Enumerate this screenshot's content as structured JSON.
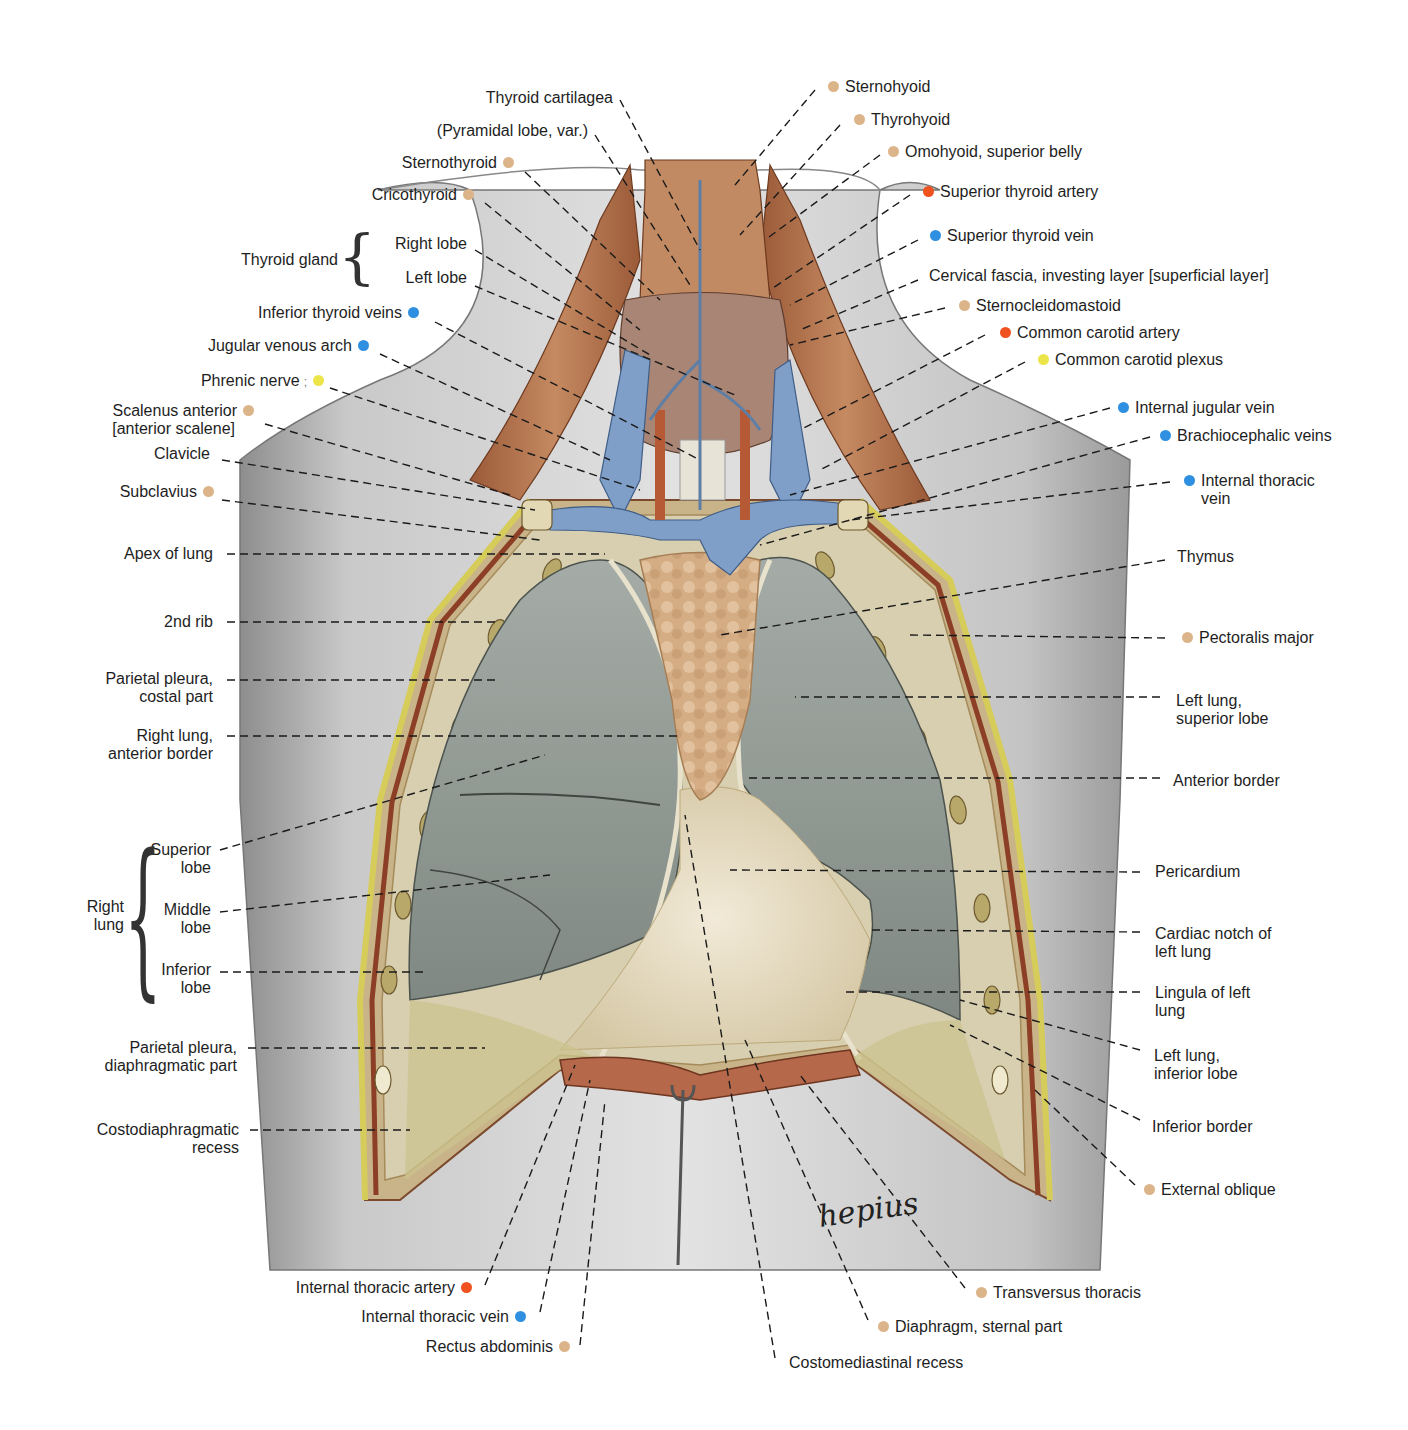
{
  "figure": {
    "signature": "hepius",
    "colors": {
      "muscle_dot": "#dcb48a",
      "artery_dot": "#f0521f",
      "vein_dot": "#2f8fe0",
      "nerve_dot": "#ece54a",
      "skin": "#cfcfcf",
      "muscle": "#b5734c",
      "vein": "#7f9fc8",
      "lung": "#8e9690",
      "pleura": "#d8cfb0",
      "thymus": "#d9b48e",
      "pericardium": "#e6dcc6",
      "rib_fat": "#d9cf62"
    }
  },
  "labels_left": [
    {
      "text": "Thyroid cartilagea",
      "dot": null
    },
    {
      "text": "(Pyramidal lobe, var.)",
      "dot": null
    },
    {
      "text": "Sternothyroid",
      "dot": "muscle"
    },
    {
      "text": "Cricothyroid",
      "dot": "muscle"
    },
    {
      "text": "Thyroid gland",
      "dot": null
    },
    {
      "text": "Right lobe",
      "dot": null
    },
    {
      "text": "Left lobe",
      "dot": null
    },
    {
      "text": "Inferior thyroid veins",
      "dot": "vein"
    },
    {
      "text": "Jugular venous arch",
      "dot": "vein"
    },
    {
      "text": "Phrenic nerve",
      "dot": "nerve"
    },
    {
      "text": "Scalenus anterior",
      "dot": "muscle"
    },
    {
      "text": "[anterior scalene]",
      "dot": null
    },
    {
      "text": "Clavicle",
      "dot": null
    },
    {
      "text": "Subclavius",
      "dot": "muscle"
    },
    {
      "text": "Apex of lung",
      "dot": null
    },
    {
      "text": "2nd rib",
      "dot": null
    },
    {
      "text": "Parietal pleura,",
      "dot": null
    },
    {
      "text": "costal part",
      "dot": null
    },
    {
      "text": "Right lung,",
      "dot": null
    },
    {
      "text": "anterior border",
      "dot": null
    },
    {
      "text": "Superior",
      "dot": null
    },
    {
      "text": "lobe",
      "dot": null
    },
    {
      "text": "Right",
      "dot": null
    },
    {
      "text": "lung",
      "dot": null
    },
    {
      "text": "Middle",
      "dot": null
    },
    {
      "text": "lobe",
      "dot": null
    },
    {
      "text": "Inferior",
      "dot": null
    },
    {
      "text": "lobe",
      "dot": null
    },
    {
      "text": "Parietal pleura,",
      "dot": null
    },
    {
      "text": "diaphragmatic part",
      "dot": null
    },
    {
      "text": "Costodiaphragmatic",
      "dot": null
    },
    {
      "text": "recess",
      "dot": null
    }
  ],
  "labels_right": [
    {
      "text": "Sternohyoid",
      "dot": "muscle"
    },
    {
      "text": "Thyrohyoid",
      "dot": "muscle"
    },
    {
      "text": "Omohyoid, superior belly",
      "dot": "muscle"
    },
    {
      "text": "Superior thyroid artery",
      "dot": "artery"
    },
    {
      "text": "Superior thyroid vein",
      "dot": "vein"
    },
    {
      "text": "Cervical fascia, investing layer [superficial layer]",
      "dot": null
    },
    {
      "text": "Sternocleidomastoid",
      "dot": "muscle"
    },
    {
      "text": "Common carotid artery",
      "dot": "artery"
    },
    {
      "text": "Common carotid plexus",
      "dot": "nerve"
    },
    {
      "text": "Internal jugular vein",
      "dot": "vein"
    },
    {
      "text": "Brachiocephalic veins",
      "dot": "vein"
    },
    {
      "text": "Internal thoracic",
      "dot": "vein"
    },
    {
      "text": "vein",
      "dot": null
    },
    {
      "text": "Thymus",
      "dot": null
    },
    {
      "text": "Pectoralis major",
      "dot": "muscle"
    },
    {
      "text": "Left lung,",
      "dot": null
    },
    {
      "text": "superior lobe",
      "dot": null
    },
    {
      "text": "Anterior border",
      "dot": null
    },
    {
      "text": "Pericardium",
      "dot": null
    },
    {
      "text": "Cardiac notch of",
      "dot": null
    },
    {
      "text": "left lung",
      "dot": null
    },
    {
      "text": "Lingula of left",
      "dot": null
    },
    {
      "text": "lung",
      "dot": null
    },
    {
      "text": "Left lung,",
      "dot": null
    },
    {
      "text": "inferior lobe",
      "dot": null
    },
    {
      "text": "Inferior border",
      "dot": null
    },
    {
      "text": "External oblique",
      "dot": "muscle"
    }
  ],
  "labels_bottom": [
    {
      "text": "Internal thoracic artery",
      "dot": "artery"
    },
    {
      "text": "Internal thoracic vein",
      "dot": "vein"
    },
    {
      "text": "Rectus abdominis",
      "dot": "muscle"
    },
    {
      "text": "Costomediastinal recess",
      "dot": null
    },
    {
      "text": "Diaphragm, sternal part",
      "dot": "muscle"
    },
    {
      "text": "Transversus thoracis",
      "dot": "muscle"
    }
  ]
}
